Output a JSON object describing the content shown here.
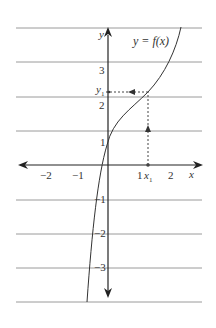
{
  "diagram": {
    "title": "y = f(x)",
    "function_label": "y = f(x)",
    "x_axis_label": "x",
    "y_axis_label": "y",
    "x_ticks": [
      "−2",
      "−1",
      "1",
      "2"
    ],
    "y_ticks": [
      "3",
      "2",
      "1",
      "−1",
      "−2",
      "−3"
    ],
    "x1_label": "x",
    "x1_sub": "1",
    "y1_label": "y",
    "y1_sub": "1",
    "colors": {
      "axis": "#222222",
      "grid": "#999999",
      "curve": "#333333",
      "dashed": "#444444"
    }
  }
}
